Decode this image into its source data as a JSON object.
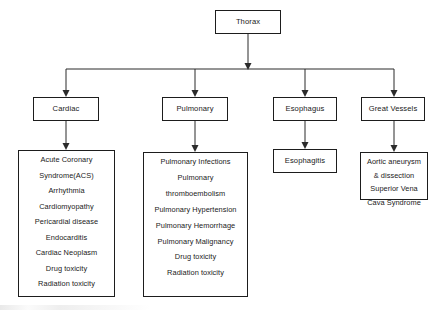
{
  "diagram": {
    "type": "flowchart",
    "title": "Thorax",
    "root": {
      "label": "Thorax"
    },
    "categories": [
      {
        "label": "Cardiac",
        "items": [
          "Acute Coronary",
          "Syndrome(ACS)",
          "Arrhythmia",
          "Cardiomyopathy",
          "Pericardial disease",
          "Endocarditis",
          "Cardiac Neoplasm",
          "Drug toxicity",
          "Radiation toxicity"
        ]
      },
      {
        "label": "Pulmonary",
        "items": [
          "Pulmonary Infections",
          "Pulmonary",
          "thromboembolism",
          "Pulmonary Hypertension",
          "Pulmonary Hemorrhage",
          "Pulmonary Malignancy",
          "Drug toxicity",
          "Radiation toxicity"
        ]
      },
      {
        "label": "Esophagus",
        "items": [
          "Esophagitis"
        ]
      },
      {
        "label": "Great Vessels",
        "items": [
          "Aortic aneurysm",
          "& dissection",
          "Superior Vena",
          "Cava Syndrome"
        ]
      }
    ],
    "colors": {
      "stroke": "#1d1d1d",
      "text": "#1a1a1a",
      "background": "#ffffff"
    }
  }
}
